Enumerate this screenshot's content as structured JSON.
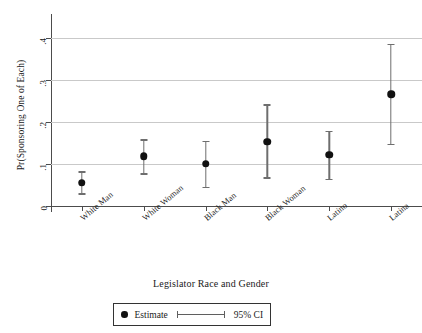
{
  "chart_data": {
    "type": "scatter",
    "title": "",
    "xlabel": "Legislator Race and Gender",
    "ylabel": "Pr(Sponsoring One of Each)",
    "categories": [
      "White Man",
      "White Woman",
      "Black Man",
      "Black Woman",
      "Latino",
      "Latina"
    ],
    "values": [
      0.055,
      0.118,
      0.1,
      0.153,
      0.122,
      0.265
    ],
    "ci_low": [
      0.03,
      0.078,
      0.045,
      0.068,
      0.065,
      0.148
    ],
    "ci_high": [
      0.082,
      0.158,
      0.155,
      0.242,
      0.178,
      0.385
    ],
    "ylim": [
      0,
      0.43
    ],
    "yticks": [
      0,
      0.1,
      0.2,
      0.3,
      0.4
    ],
    "ytick_labels": [
      "0",
      ".1",
      ".2",
      ".3",
      ".4"
    ],
    "grid": true,
    "legend_position": "bottom",
    "legend": [
      {
        "key": "estimate",
        "label": "Estimate",
        "marker": "dot"
      },
      {
        "key": "ci",
        "label": "95% CI",
        "marker": "errorbar"
      }
    ],
    "colors": {
      "point": "#111111",
      "errorbar": "#6e6e6e",
      "gridline": "#c9c9c9",
      "axis": "#4c4c4c",
      "background": "#ffffff"
    }
  }
}
